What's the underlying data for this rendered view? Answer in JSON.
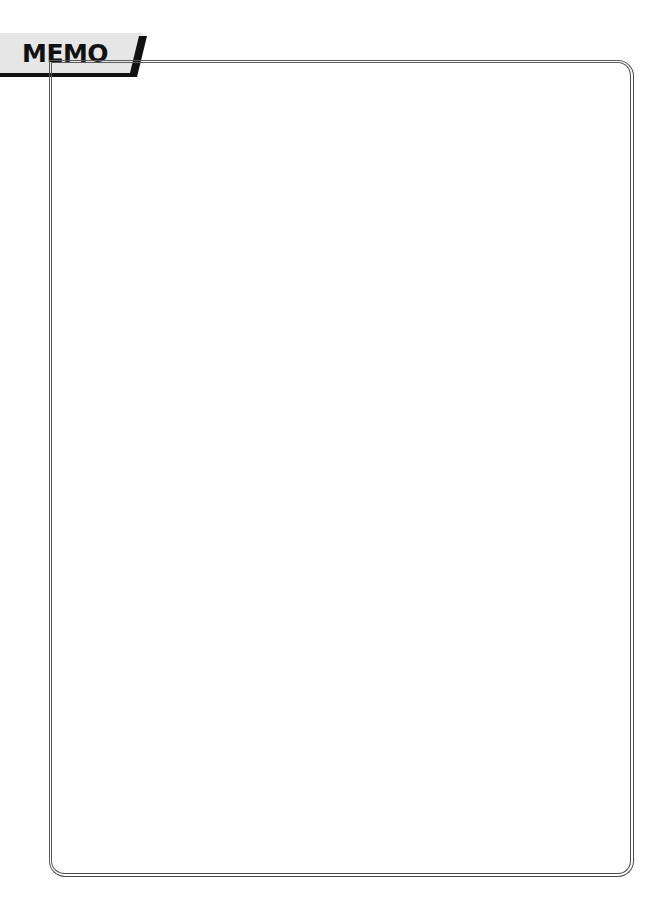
{
  "header": {
    "tab_label": "MEMO",
    "tab_bg_color": "#e6e6e6",
    "tab_accent_color": "#111111"
  },
  "memo_area": {
    "content": "",
    "border_color": "#4a4a4a"
  }
}
